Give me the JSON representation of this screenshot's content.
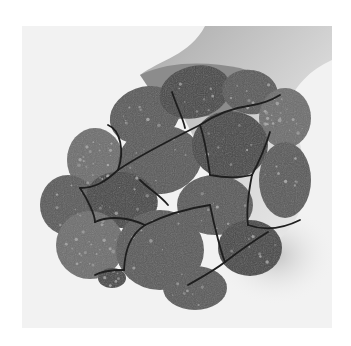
{
  "image": {
    "alt": "Grayscale photograph of a hand holding a dark, lumpy clod broken into rounded segments by a network of cracks",
    "subject": "cracked segmented clod",
    "palette": {
      "background": "#ffffff",
      "photo_paper": "#f2f2f2",
      "hand_light": "#d9d9d9",
      "hand_mid": "#a9a9a9",
      "hand_dark": "#8c8c8c",
      "clod_base": "#5a5a5a",
      "clod_dark": "#474747",
      "clod_light": "#6e6e6e",
      "speckle": "#b5b5b5",
      "crack": "#1e1e1e"
    }
  }
}
